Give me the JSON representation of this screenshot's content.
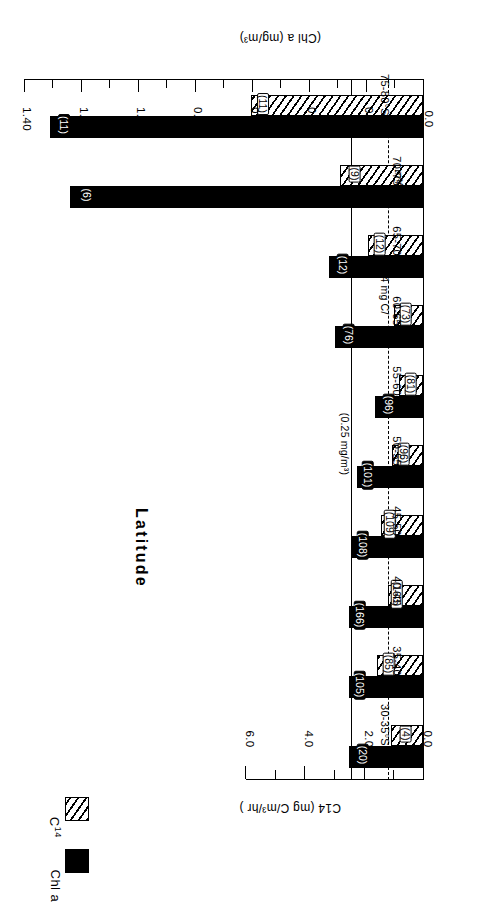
{
  "chart_data": {
    "type": "bar",
    "orientation": "horizontal-grouped",
    "title": "",
    "xlabel": "Latitude",
    "categories": [
      "30-35°S",
      "35-40",
      "40-45",
      "45-50",
      "50-55",
      "55-60",
      "60-65",
      "65-70",
      "70-75",
      "75-80°S"
    ],
    "series": [
      {
        "name": "Chl a",
        "axis": "Chl a (mg/m³)",
        "units": "mg/m³",
        "fill": "solid-black",
        "color": "#000000",
        "values": [
          0.26,
          0.26,
          0.26,
          0.25,
          0.23,
          0.17,
          0.31,
          0.33,
          1.24,
          1.31
        ],
        "point_labels": [
          "(20)",
          "(105)",
          "(166)",
          "(108)",
          "(101)",
          "(96)",
          "(76)",
          "(12)",
          "(6)",
          "(11)"
        ]
      },
      {
        "name": "C14",
        "axis": "C14 (mg C/m³/hr)",
        "units": "mg C/m³/hr",
        "fill": "hatched",
        "color": "#000000",
        "values": [
          1.07,
          1.55,
          1.17,
          1.4,
          1.05,
          0.8,
          0.98,
          1.85,
          2.8,
          5.8
        ],
        "point_labels": [
          "(4)",
          "(85)",
          "(163)",
          "(109)",
          "(96)",
          "(81)",
          "(73)",
          "(12)",
          "(9)",
          "(11)"
        ]
      }
    ],
    "axes": {
      "chla": {
        "label": "(Chl a  (mg/m³)",
        "label_text": "(Chl a   (mg/m³)",
        "min": 0.0,
        "max": 1.4,
        "major_step": 0.2,
        "minor_step": 0.1,
        "ticks": [
          "0.0",
          "0.20",
          "0.40",
          "0.60",
          "0.80",
          "1.00",
          "1.20",
          "1.40"
        ],
        "position": "bottom"
      },
      "c14": {
        "label_text": "C14  (mg C/m³/hr )",
        "min": 0.0,
        "max": 6.0,
        "major_step": 2.0,
        "minor_step": 1.0,
        "ticks": [
          "0.0",
          "2.0",
          "4.0",
          "6.0"
        ],
        "position": "top"
      },
      "category": {
        "label": "Latitude"
      }
    },
    "reference_lines": [
      {
        "style": "solid",
        "axis": "chla",
        "value": 0.25,
        "annotation": "(0.25 mg/m³)"
      },
      {
        "style": "dashed",
        "axis": "c14",
        "value": 1.14,
        "annotation": "(1.14 mg C/ m³/hr)"
      }
    ],
    "annotations": [
      {
        "text": "(0.25 mg/m³)"
      },
      {
        "text": "(1.14 mg C/"
      },
      {
        "text": "m³/hr)"
      }
    ],
    "grid": false,
    "legend": {
      "position": "upper-left",
      "entries": [
        {
          "label": "Chl a",
          "swatch": "solid-black"
        },
        {
          "label": "C",
          "sup": "14",
          "swatch": "hatched"
        }
      ]
    }
  },
  "ticks_chla": [
    {
      "v": "0.0",
      "major": true
    },
    {
      "v": "",
      "major": false
    },
    {
      "v": "0.20",
      "major": true
    },
    {
      "v": "",
      "major": false
    },
    {
      "v": "0.40",
      "major": true
    },
    {
      "v": "",
      "major": false
    },
    {
      "v": "0.60",
      "major": true
    },
    {
      "v": "",
      "major": false
    },
    {
      "v": "0.80",
      "major": true
    },
    {
      "v": "",
      "major": false
    },
    {
      "v": "1.00",
      "major": true
    },
    {
      "v": "",
      "major": false
    },
    {
      "v": "1.20",
      "major": true
    },
    {
      "v": "",
      "major": false
    },
    {
      "v": "1.40",
      "major": true
    }
  ],
  "ticks_c14": [
    {
      "v": "0.0",
      "major": true
    },
    {
      "v": "",
      "major": false
    },
    {
      "v": "2.0",
      "major": true
    },
    {
      "v": "",
      "major": false
    },
    {
      "v": "4.0",
      "major": true
    },
    {
      "v": "",
      "major": false
    },
    {
      "v": "6.0",
      "major": true
    }
  ]
}
